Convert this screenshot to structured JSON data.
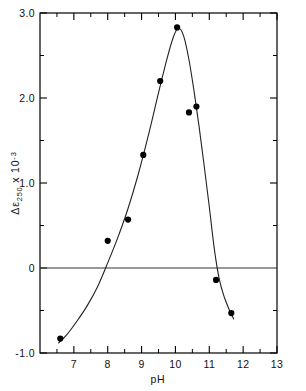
{
  "chart_data": {
    "type": "scatter",
    "title": "",
    "xlabel": "pH",
    "ylabel": "Δε250 x 10-3",
    "ylabel_parts": {
      "delta": "Δ",
      "epsilon": "ε",
      "subscript": "250",
      "times": "x 10",
      "exponent": "-3"
    },
    "xlim": [
      6.0,
      13.0
    ],
    "ylim": [
      -1.0,
      3.0
    ],
    "grid": false,
    "legend": null,
    "x_major_ticks": [
      7,
      8,
      9,
      10,
      11,
      12,
      13
    ],
    "x_major_tick_labels": [
      "7",
      "8",
      "9",
      "10",
      "11",
      "12",
      "13"
    ],
    "x_minor_ticks": [
      6.5,
      7.5,
      8.5,
      9.5,
      10.5,
      11.5,
      12.5
    ],
    "y_major_ticks": [
      -1.0,
      0,
      1.0,
      2.0,
      3.0
    ],
    "y_major_tick_labels": [
      "-1.0",
      "0",
      "1.0",
      "2.0",
      "3.0"
    ],
    "y_minor_ticks": [
      -0.5,
      0.5,
      1.5,
      2.5
    ],
    "zero_line": 0,
    "marker": "filled-circle",
    "marker_color": "#000000",
    "curve_color": "#222222",
    "axis_color": "#000000",
    "points": [
      {
        "x": 6.6,
        "y": -0.83
      },
      {
        "x": 8.0,
        "y": 0.32
      },
      {
        "x": 8.6,
        "y": 0.57
      },
      {
        "x": 9.05,
        "y": 1.33
      },
      {
        "x": 9.55,
        "y": 2.2
      },
      {
        "x": 10.05,
        "y": 2.83
      },
      {
        "x": 10.4,
        "y": 1.83
      },
      {
        "x": 10.62,
        "y": 1.9
      },
      {
        "x": 11.2,
        "y": -0.14
      },
      {
        "x": 11.65,
        "y": -0.53
      }
    ],
    "curve": [
      {
        "x": 6.55,
        "y": -0.88
      },
      {
        "x": 6.8,
        "y": -0.78
      },
      {
        "x": 7.1,
        "y": -0.62
      },
      {
        "x": 7.4,
        "y": -0.44
      },
      {
        "x": 7.7,
        "y": -0.22
      },
      {
        "x": 8.0,
        "y": 0.06
      },
      {
        "x": 8.3,
        "y": 0.36
      },
      {
        "x": 8.6,
        "y": 0.7
      },
      {
        "x": 8.9,
        "y": 1.1
      },
      {
        "x": 9.2,
        "y": 1.56
      },
      {
        "x": 9.5,
        "y": 2.06
      },
      {
        "x": 9.75,
        "y": 2.46
      },
      {
        "x": 9.95,
        "y": 2.73
      },
      {
        "x": 10.1,
        "y": 2.82
      },
      {
        "x": 10.25,
        "y": 2.72
      },
      {
        "x": 10.4,
        "y": 2.45
      },
      {
        "x": 10.55,
        "y": 2.08
      },
      {
        "x": 10.7,
        "y": 1.66
      },
      {
        "x": 10.85,
        "y": 1.2
      },
      {
        "x": 11.0,
        "y": 0.72
      },
      {
        "x": 11.15,
        "y": 0.22
      },
      {
        "x": 11.3,
        "y": -0.14
      },
      {
        "x": 11.45,
        "y": -0.35
      },
      {
        "x": 11.6,
        "y": -0.5
      },
      {
        "x": 11.72,
        "y": -0.6
      }
    ]
  }
}
